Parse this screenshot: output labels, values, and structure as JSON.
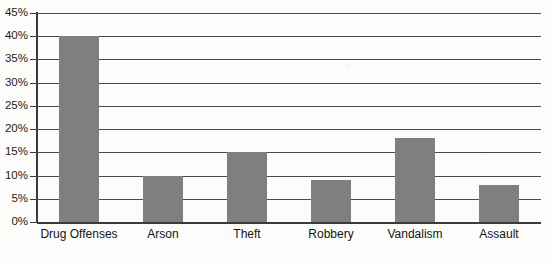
{
  "chart_data": {
    "type": "bar",
    "title": "",
    "subtitle": "",
    "xlabel": "",
    "ylabel": "",
    "categories": [
      "Drug Offenses",
      "Arson",
      "Theft",
      "Robbery",
      "Vandalism",
      "Assault"
    ],
    "values": [
      40,
      10,
      15,
      9,
      18,
      8
    ],
    "value_suffix": "%",
    "ylim": [
      0,
      45
    ],
    "ytick_values": [
      0,
      5,
      10,
      15,
      20,
      25,
      30,
      35,
      40,
      45
    ],
    "ytick_labels": [
      "0%",
      "5%",
      "10%",
      "15%",
      "20%",
      "25%",
      "30%",
      "35%",
      "40%",
      "45%"
    ],
    "grid": true,
    "legend": false,
    "legend_position": "none",
    "bar_color": "#7f7f7f",
    "axis_color": "#3a3a3a",
    "grid_color": "#4a4a4a",
    "background_color": "#fcfcfa"
  }
}
